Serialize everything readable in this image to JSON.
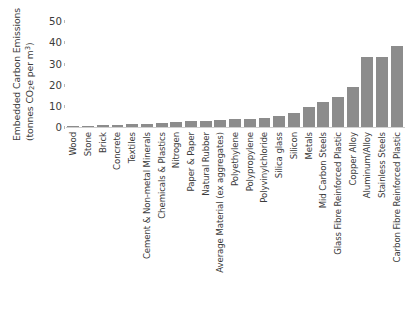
{
  "chart_data": {
    "type": "bar",
    "title": "",
    "xlabel": "",
    "ylabel": "Embedded Carbon Emissions (tonnes CO2e per m3)",
    "ylabel_line1": "Embedded Carbon Emissions",
    "ylabel_line2_prefix": "(tonnes CO",
    "ylabel_line2_sub": "2",
    "ylabel_line2_mid": "e per m",
    "ylabel_line2_sup": "3",
    "ylabel_line2_suffix": ")",
    "ylim": [
      0,
      52
    ],
    "yticks": [
      0,
      10,
      20,
      30,
      40,
      50
    ],
    "ytick_labels": [
      "0",
      "10",
      "20",
      "30",
      "40",
      "50"
    ],
    "grid": false,
    "legend": "none",
    "bar_color": "#8c8c8c",
    "axis_color": "#cfcfcf",
    "text_color": "#3b3b3b",
    "categories": [
      "Wood",
      "Stone",
      "Brick",
      "Concrete",
      "Textiles",
      "Cement & Non-metal Minerals",
      "Chemicals & Plastics",
      "Nitrogen",
      "Paper & Paper",
      "Natural Rubber",
      "Average Material (ex aggregates)",
      "Polyethylene",
      "Polypropylene",
      "Polyvinylchloride",
      "Silica glass",
      "Silicon",
      "Metals",
      "Mid Carbon Steels",
      "Glass Fibre Reinforced Plastic",
      "Copper Alloy",
      "Aluminum/Alloy",
      "Stainless Steels",
      "Carbon Fibre Reinforced Plastic"
    ],
    "values": [
      0.6,
      0.7,
      0.9,
      1.1,
      1.3,
      1.6,
      2.0,
      2.4,
      2.7,
      3.0,
      3.4,
      3.7,
      4.0,
      4.4,
      5.2,
      6.4,
      9.6,
      12.0,
      14.4,
      19.0,
      33.0,
      33.2,
      38.5
    ]
  }
}
